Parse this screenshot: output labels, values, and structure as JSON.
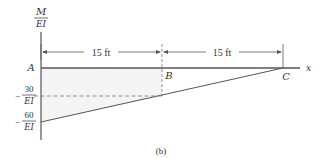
{
  "diagram": {
    "caption": "(b)",
    "y_axis_label": {
      "numerator": "M",
      "denominator": "EI"
    },
    "x_axis_label": "x",
    "points": [
      {
        "name": "A",
        "x_ft": 0
      },
      {
        "name": "B",
        "x_ft": 15
      },
      {
        "name": "C",
        "x_ft": 30
      }
    ],
    "dimensions": [
      {
        "label": "15 ft",
        "from": "A",
        "to": "B"
      },
      {
        "label": "15 ft",
        "from": "B",
        "to": "C"
      }
    ],
    "y_ticks": [
      {
        "value": -30,
        "sign": "−",
        "numerator": "30",
        "denominator": "EI"
      },
      {
        "value": -60,
        "sign": "−",
        "numerator": "60",
        "denominator": "EI"
      }
    ],
    "mdiagram": {
      "description": "Linear M/EI diagram from -60/EI at A to 0 at C",
      "start": {
        "x_ft": 0,
        "value": -60
      },
      "end": {
        "x_ft": 30,
        "value": 0
      }
    },
    "colors": {
      "line": "#555555",
      "shade": "#f4f4f4",
      "text": "#333333"
    }
  }
}
